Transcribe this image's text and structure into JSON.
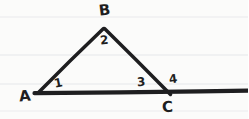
{
  "figure": {
    "kind": "hand-drawn-geometry-diagram",
    "medium": "ruled notebook paper",
    "background_color": "#fbfbfa",
    "ink_color": "#1e1e20",
    "rule_color": "#e6e7e9",
    "width": 248,
    "height": 119,
    "rules": [
      {
        "name": "rule-1",
        "y": 17
      },
      {
        "name": "rule-2",
        "y": 55
      },
      {
        "name": "rule-3",
        "y": 84
      },
      {
        "name": "rule-4",
        "y": 111
      }
    ],
    "vertices": [
      {
        "name": "A",
        "x": 38,
        "y": 92
      },
      {
        "name": "B",
        "x": 104,
        "y": 28
      },
      {
        "name": "C",
        "x": 168,
        "y": 92
      }
    ],
    "strokes": [
      {
        "name": "segment-ab",
        "from": [
          38,
          92
        ],
        "to": [
          104,
          28
        ],
        "width": 3.6
      },
      {
        "name": "segment-bc",
        "from": [
          104,
          28
        ],
        "to": [
          170,
          94
        ],
        "width": 3.6
      },
      {
        "name": "segment-ac-extended",
        "from": [
          34,
          93
        ],
        "to": [
          248,
          91
        ],
        "width": 4.2
      }
    ]
  },
  "labels": {
    "vertex_a": "A",
    "vertex_b": "B",
    "vertex_c": "C",
    "angle_1": "1",
    "angle_2": "2",
    "angle_3": "3",
    "angle_4": "4"
  }
}
